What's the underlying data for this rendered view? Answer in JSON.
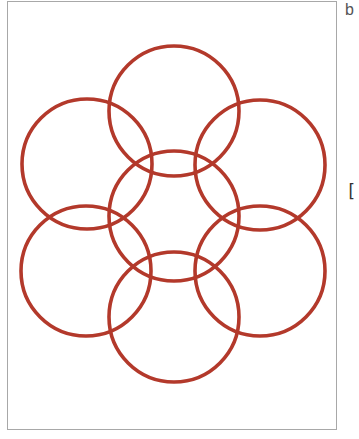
{
  "panel": {
    "label": "b",
    "side_mark": "["
  },
  "diagram": {
    "stroke_color": "#b3392b",
    "stroke_width": 3.6,
    "radius": 65,
    "circles": [
      {
        "name": "top",
        "cx": 174,
        "cy": 111
      },
      {
        "name": "upper-left",
        "cx": 87,
        "cy": 164
      },
      {
        "name": "upper-right",
        "cx": 260,
        "cy": 165
      },
      {
        "name": "center",
        "cx": 174,
        "cy": 216
      },
      {
        "name": "lower-left",
        "cx": 86,
        "cy": 271
      },
      {
        "name": "lower-right",
        "cx": 260,
        "cy": 271
      },
      {
        "name": "bottom",
        "cx": 174,
        "cy": 317
      }
    ]
  }
}
